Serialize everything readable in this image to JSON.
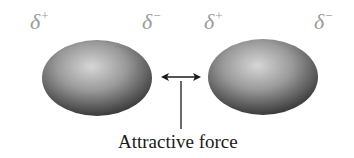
{
  "diagram": {
    "molecules": [
      {
        "id": "left",
        "charge_left": {
          "symbol": "δ",
          "sign": "+"
        },
        "charge_right": {
          "symbol": "δ",
          "sign": "−"
        }
      },
      {
        "id": "right",
        "charge_left": {
          "symbol": "δ",
          "sign": "+"
        },
        "charge_right": {
          "symbol": "δ",
          "sign": "−"
        }
      }
    ],
    "arrow": {
      "type": "double-headed"
    },
    "caption": "Attractive force",
    "colors": {
      "charge_label": "#9a9a9a",
      "molecule_highlight": "#d8d8d8",
      "molecule_shadow": "#3a3a3a",
      "arrow": "#1a1a1a"
    }
  }
}
